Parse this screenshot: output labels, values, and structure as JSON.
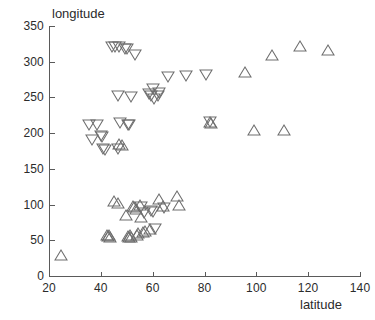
{
  "chart_data": {
    "type": "scatter",
    "title": "",
    "xlabel": "latitude",
    "ylabel": "longitude",
    "xlim": [
      20,
      140
    ],
    "ylim": [
      0,
      350
    ],
    "xticks": [
      20,
      40,
      60,
      80,
      100,
      120,
      140
    ],
    "yticks": [
      0,
      50,
      100,
      150,
      200,
      250,
      300,
      350
    ],
    "grid": false,
    "legend": "none",
    "series": [
      {
        "name": "up-triangle",
        "marker": "triangle-up",
        "color": "#6e6e6e",
        "filled": false,
        "points": [
          [
            24.5,
            30
          ],
          [
            42.5,
            57
          ],
          [
            42.8,
            56
          ],
          [
            43.2,
            58
          ],
          [
            43.6,
            55
          ],
          [
            45.0,
            105
          ],
          [
            46.5,
            102
          ],
          [
            47.2,
            185
          ],
          [
            48.0,
            183
          ],
          [
            49.8,
            85
          ],
          [
            50.5,
            56
          ],
          [
            50.9,
            54
          ],
          [
            51.4,
            57
          ],
          [
            51.8,
            55
          ],
          [
            52.4,
            98
          ],
          [
            52.9,
            96
          ],
          [
            53.4,
            94
          ],
          [
            53.8,
            58
          ],
          [
            54.4,
            60
          ],
          [
            55.0,
            100
          ],
          [
            55.6,
            83
          ],
          [
            56.2,
            62
          ],
          [
            57.0,
            63
          ],
          [
            59.0,
            66
          ],
          [
            62.5,
            108
          ],
          [
            64.0,
            98
          ],
          [
            69.5,
            112
          ],
          [
            70.0,
            100
          ],
          [
            82.0,
            215
          ],
          [
            82.4,
            214
          ],
          [
            95.5,
            285
          ],
          [
            99.0,
            205
          ],
          [
            106.0,
            310
          ],
          [
            110.5,
            205
          ],
          [
            117.0,
            322
          ],
          [
            127.5,
            317
          ]
        ]
      },
      {
        "name": "down-triangle",
        "marker": "triangle-down",
        "color": "#6e6e6e",
        "filled": false,
        "points": [
          [
            35.5,
            212
          ],
          [
            38.5,
            211
          ],
          [
            36.5,
            190
          ],
          [
            40.0,
            196
          ],
          [
            40.6,
            194
          ],
          [
            41.0,
            178
          ],
          [
            41.6,
            176
          ],
          [
            44.5,
            320
          ],
          [
            45.6,
            320
          ],
          [
            47.0,
            320
          ],
          [
            49.5,
            318
          ],
          [
            50.2,
            318
          ],
          [
            46.5,
            252
          ],
          [
            46.8,
            178
          ],
          [
            47.5,
            214
          ],
          [
            50.5,
            212
          ],
          [
            51.0,
            211
          ],
          [
            51.5,
            250
          ],
          [
            53.0,
            310
          ],
          [
            55.5,
            96
          ],
          [
            56.5,
            88
          ],
          [
            58.5,
            255
          ],
          [
            59.2,
            252
          ],
          [
            60.0,
            262
          ],
          [
            60.6,
            248
          ],
          [
            59.5,
            91
          ],
          [
            60.2,
            90
          ],
          [
            61.0,
            66
          ],
          [
            62.0,
            252
          ],
          [
            62.6,
            256
          ],
          [
            64.5,
            95
          ],
          [
            66.0,
            278
          ],
          [
            73.0,
            280
          ],
          [
            80.5,
            282
          ],
          [
            82.2,
            216
          ]
        ]
      }
    ]
  }
}
